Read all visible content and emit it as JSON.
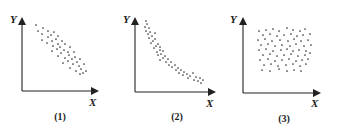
{
  "colors": {
    "ink": "#222222",
    "dot": "#333333",
    "background": "#ffffff"
  },
  "chart_data": [
    {
      "type": "scatter",
      "caption": "(1)",
      "xlabel": "X",
      "ylabel": "Y",
      "relationship": "linear negative correlation",
      "grid": false,
      "frame": {
        "origin_x": 22,
        "origin_y": 91,
        "y_top": 15,
        "x_right": 101
      },
      "labels": {
        "ylabel_pos": [
          10,
          14
        ],
        "xlabel_pos": [
          89,
          97
        ],
        "caption_pos": [
          60,
          112
        ]
      },
      "points": [
        [
          36,
          25
        ],
        [
          43,
          28
        ],
        [
          38,
          31
        ],
        [
          48,
          31
        ],
        [
          54,
          32
        ],
        [
          42,
          34
        ],
        [
          51,
          35
        ],
        [
          58,
          36
        ],
        [
          48,
          37
        ],
        [
          56,
          39
        ],
        [
          42,
          40
        ],
        [
          52,
          41
        ],
        [
          62,
          41
        ],
        [
          47,
          43
        ],
        [
          58,
          44
        ],
        [
          65,
          44
        ],
        [
          53,
          46
        ],
        [
          60,
          47
        ],
        [
          70,
          47
        ],
        [
          57,
          49
        ],
        [
          64,
          50
        ],
        [
          52,
          51
        ],
        [
          68,
          52
        ],
        [
          74,
          52
        ],
        [
          61,
          53
        ],
        [
          69,
          55
        ],
        [
          58,
          56
        ],
        [
          75,
          57
        ],
        [
          65,
          58
        ],
        [
          72,
          59
        ],
        [
          80,
          59
        ],
        [
          68,
          61
        ],
        [
          77,
          62
        ],
        [
          63,
          63
        ],
        [
          73,
          64
        ],
        [
          84,
          64
        ],
        [
          79,
          66
        ],
        [
          70,
          68
        ],
        [
          81,
          69
        ],
        [
          76,
          71
        ],
        [
          86,
          71
        ],
        [
          83,
          73
        ],
        [
          80,
          74
        ]
      ]
    },
    {
      "type": "scatter",
      "caption": "(2)",
      "xlabel": "X",
      "ylabel": "Y",
      "relationship": "nonlinear (curved) negative correlation",
      "grid": false,
      "frame": {
        "origin_x": 135,
        "origin_y": 92,
        "y_top": 15,
        "x_right": 218
      },
      "labels": {
        "ylabel_pos": [
          123,
          14
        ],
        "xlabel_pos": [
          206,
          98
        ],
        "caption_pos": [
          177,
          112
        ]
      },
      "points": [
        [
          146,
          21
        ],
        [
          147,
          24
        ],
        [
          145,
          27
        ],
        [
          149,
          28
        ],
        [
          146,
          31
        ],
        [
          150,
          32
        ],
        [
          148,
          34
        ],
        [
          155,
          33
        ],
        [
          152,
          36
        ],
        [
          149,
          38
        ],
        [
          155,
          39
        ],
        [
          153,
          41
        ],
        [
          151,
          43
        ],
        [
          158,
          44
        ],
        [
          156,
          46
        ],
        [
          160,
          47
        ],
        [
          154,
          48
        ],
        [
          160,
          50
        ],
        [
          157,
          52
        ],
        [
          163,
          51
        ],
        [
          161,
          54
        ],
        [
          158,
          55
        ],
        [
          165,
          56
        ],
        [
          163,
          58
        ],
        [
          168,
          59
        ],
        [
          160,
          60
        ],
        [
          166,
          62
        ],
        [
          171,
          62
        ],
        [
          169,
          65
        ],
        [
          175,
          65
        ],
        [
          172,
          67
        ],
        [
          178,
          68
        ],
        [
          176,
          70
        ],
        [
          181,
          70
        ],
        [
          184,
          72
        ],
        [
          179,
          73
        ],
        [
          187,
          74
        ],
        [
          183,
          75
        ],
        [
          190,
          76
        ],
        [
          193,
          73
        ],
        [
          188,
          78
        ],
        [
          196,
          77
        ],
        [
          200,
          78
        ],
        [
          194,
          80
        ],
        [
          198,
          81
        ],
        [
          203,
          80
        ],
        [
          201,
          83
        ]
      ]
    },
    {
      "type": "scatter",
      "caption": "(3)",
      "xlabel": "X",
      "ylabel": "Y",
      "relationship": "no correlation",
      "grid": false,
      "frame": {
        "origin_x": 243,
        "origin_y": 93,
        "y_top": 15,
        "x_right": 323
      },
      "labels": {
        "ylabel_pos": [
          230,
          14
        ],
        "xlabel_pos": [
          311,
          98
        ],
        "caption_pos": [
          284,
          114
        ]
      },
      "points": [
        [
          259,
          31
        ],
        [
          266,
          30
        ],
        [
          273,
          29
        ],
        [
          279,
          31
        ],
        [
          287,
          28
        ],
        [
          293,
          30
        ],
        [
          300,
          31
        ],
        [
          305,
          29
        ],
        [
          263,
          35
        ],
        [
          270,
          34
        ],
        [
          277,
          36
        ],
        [
          284,
          35
        ],
        [
          291,
          34
        ],
        [
          297,
          36
        ],
        [
          303,
          35
        ],
        [
          310,
          34
        ],
        [
          258,
          40
        ],
        [
          265,
          39
        ],
        [
          272,
          41
        ],
        [
          280,
          40
        ],
        [
          288,
          41
        ],
        [
          294,
          39
        ],
        [
          301,
          41
        ],
        [
          308,
          40
        ],
        [
          261,
          45
        ],
        [
          268,
          44
        ],
        [
          275,
          46
        ],
        [
          282,
          45
        ],
        [
          290,
          46
        ],
        [
          296,
          44
        ],
        [
          304,
          46
        ],
        [
          311,
          45
        ],
        [
          259,
          50
        ],
        [
          266,
          49
        ],
        [
          273,
          51
        ],
        [
          281,
          50
        ],
        [
          287,
          49
        ],
        [
          293,
          51
        ],
        [
          299,
          50
        ],
        [
          306,
          51
        ],
        [
          263,
          55
        ],
        [
          270,
          54
        ],
        [
          277,
          56
        ],
        [
          284,
          55
        ],
        [
          291,
          54
        ],
        [
          298,
          56
        ],
        [
          305,
          55
        ],
        [
          310,
          53
        ],
        [
          260,
          60
        ],
        [
          268,
          59
        ],
        [
          275,
          61
        ],
        [
          282,
          60
        ],
        [
          289,
          59
        ],
        [
          296,
          61
        ],
        [
          302,
          60
        ],
        [
          308,
          59
        ],
        [
          264,
          65
        ],
        [
          271,
          64
        ],
        [
          278,
          66
        ],
        [
          286,
          65
        ],
        [
          293,
          64
        ],
        [
          300,
          66
        ],
        [
          306,
          64
        ],
        [
          262,
          70
        ],
        [
          270,
          71
        ],
        [
          279,
          69
        ],
        [
          287,
          71
        ],
        [
          294,
          70
        ],
        [
          301,
          71
        ]
      ]
    }
  ]
}
